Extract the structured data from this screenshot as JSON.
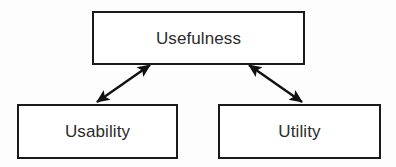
{
  "diagram": {
    "background_color": "#fdfdfd",
    "node_fill_color": "#ffffff",
    "node_border_color": "#1a1a1a",
    "text_color": "#2b2b2b",
    "edge_color": "#111111",
    "nodes": [
      {
        "id": "usefulness",
        "label": "Usefulness",
        "shape": "rectangle",
        "x": 92,
        "y": 11,
        "width": 213,
        "height": 54
      },
      {
        "id": "usability",
        "label": "Usability",
        "shape": "rectangle",
        "x": 17,
        "y": 104,
        "width": 161,
        "height": 55
      },
      {
        "id": "utility",
        "label": "Utility",
        "shape": "rectangle",
        "x": 218,
        "y": 104,
        "width": 163,
        "height": 55
      }
    ],
    "edges": [
      {
        "id": "usefulness-usability",
        "from": "usefulness",
        "to": "usability",
        "arrowheads": "both",
        "label": "",
        "x1": 150,
        "y1": 65,
        "x2": 97,
        "y2": 102
      },
      {
        "id": "usefulness-utility",
        "from": "usefulness",
        "to": "utility",
        "arrowheads": "both",
        "label": "",
        "x1": 249,
        "y1": 65,
        "x2": 302,
        "y2": 102
      }
    ]
  }
}
